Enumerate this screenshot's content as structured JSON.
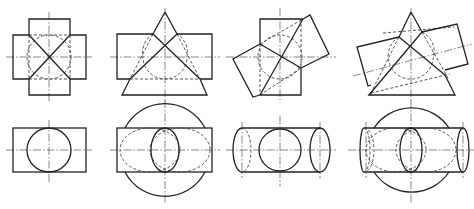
{
  "figure": {
    "title": "",
    "description": "Orthographic projections of intersecting solids (cylinders and cones), top row front views, bottom row top views",
    "colors": {
      "line": "#222222",
      "hidden": "#444444",
      "center": "#555555",
      "background": "#ffffff"
    }
  },
  "views": [
    {
      "id": "v1-front",
      "label": "Cylinder-cylinder intersection, front view",
      "center_x": 49,
      "center_y": 57
    },
    {
      "id": "v2-front",
      "label": "Cylinder-cone intersection, front view",
      "center_x": 165,
      "center_y": 57
    },
    {
      "id": "v3-front",
      "label": "Inclined cylinder-cylinder intersection, front view",
      "center_x": 280,
      "center_y": 57
    },
    {
      "id": "v4-front",
      "label": "Inclined cylinder-cone intersection, front view",
      "center_x": 411,
      "center_y": 57
    },
    {
      "id": "v1-top",
      "label": "Cylinder-cylinder intersection, top view",
      "center_x": 49,
      "center_y": 150
    },
    {
      "id": "v2-top",
      "label": "Cylinder-cone intersection, top view",
      "center_x": 165,
      "center_y": 150
    },
    {
      "id": "v3-top",
      "label": "Inclined cylinder-cylinder intersection, top view",
      "center_x": 280,
      "center_y": 150
    },
    {
      "id": "v4-top",
      "label": "Inclined cylinder-cone intersection, top view",
      "center_x": 411,
      "center_y": 150
    }
  ]
}
